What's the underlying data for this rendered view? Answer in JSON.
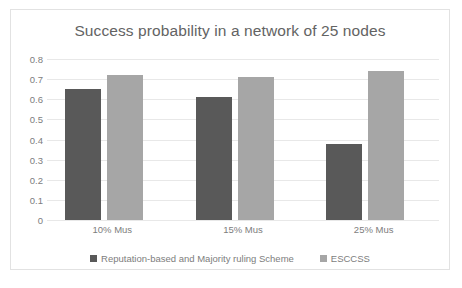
{
  "chart_data": {
    "type": "bar",
    "title": "Success probability in a network of 25 nodes",
    "xlabel": "",
    "ylabel": "",
    "categories": [
      "10% Mus",
      "15% Mus",
      "25% Mus"
    ],
    "series": [
      {
        "name": "Reputation-based and Majority ruling Scheme",
        "color": "#595959",
        "values": [
          0.65,
          0.61,
          0.38
        ]
      },
      {
        "name": "ESCCSS",
        "color": "#a6a6a6",
        "values": [
          0.72,
          0.71,
          0.74
        ]
      }
    ],
    "ylim": [
      0,
      0.8
    ],
    "ytick_labels": [
      "0.8",
      "0.7",
      "0.6",
      "0.5",
      "0.4",
      "0.3",
      "0.2",
      "0.1",
      "0"
    ],
    "ytick_values": [
      0.8,
      0.7,
      0.6,
      0.5,
      0.4,
      0.3,
      0.2,
      0.1,
      0
    ],
    "grid": true,
    "legend_position": "bottom"
  }
}
